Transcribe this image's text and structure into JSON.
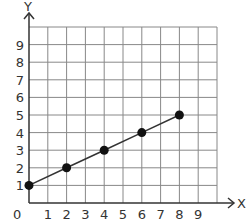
{
  "chart_data": {
    "type": "line",
    "title": "",
    "xlabel": "X",
    "ylabel": "Y",
    "x": [
      0,
      2,
      4,
      6,
      8
    ],
    "series": [
      {
        "name": "line",
        "values": [
          1,
          2,
          3,
          4,
          5
        ]
      }
    ],
    "points": [
      {
        "x": 0,
        "y": 1
      },
      {
        "x": 2,
        "y": 2
      },
      {
        "x": 4,
        "y": 3
      },
      {
        "x": 6,
        "y": 4
      },
      {
        "x": 8,
        "y": 5
      }
    ],
    "xlim": [
      0,
      10
    ],
    "ylim": [
      0,
      10
    ],
    "x_tick_labels": [
      "1",
      "2",
      "3",
      "4",
      "5",
      "6",
      "7",
      "8",
      "9"
    ],
    "y_tick_labels": [
      "1",
      "2",
      "3",
      "4",
      "5",
      "6",
      "7",
      "8",
      "9"
    ],
    "origin_label": "0",
    "grid": true,
    "legend": "none"
  },
  "colors": {
    "grid": "#888888",
    "axis": "#333333",
    "line": "#333333",
    "marker": "#111111"
  }
}
